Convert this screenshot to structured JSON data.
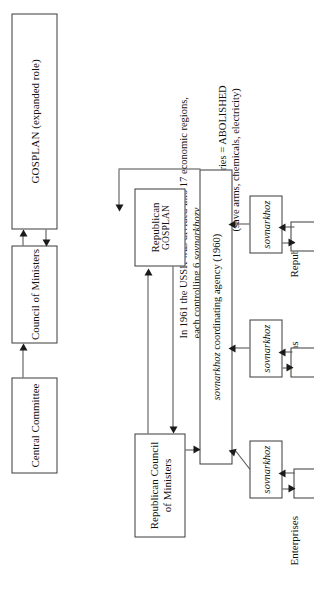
{
  "diagram": {
    "orientation": "rotated-90-counterclockwise",
    "background_color": "#ffffff",
    "line_color": "#4a4a4a",
    "text_color": "#111111"
  },
  "tier_labels": [
    {
      "id": "republics",
      "label": "Republics"
    },
    {
      "id": "regions",
      "label": "Regions"
    },
    {
      "id": "enterprises",
      "label": "Enterprises"
    }
  ],
  "boxes": {
    "gosplan_central": {
      "line1": "GOSPLAN",
      "line2": " (expanded role)"
    },
    "council_ministers": {
      "label": "Council of Ministers"
    },
    "central_committee": {
      "label": "Central Committee"
    },
    "republican_gosplan": {
      "line1": "Republican",
      "line2": "GOSPLAN"
    },
    "republican_council": {
      "line1": "Republican Council",
      "line2": "of Ministers"
    },
    "coordinating_agency": {
      "italic": "sovnarkhoz",
      "rest": " coordinating agency (1960)"
    },
    "sovnarkhoz_1": {
      "label": "sovnarkhoz"
    },
    "sovnarkhoz_2": {
      "label": "sovnarkhoz"
    },
    "sovnarkhoz_3": {
      "label": "sovnarkhoz"
    },
    "enterprise_1": {
      "label": ""
    },
    "enterprise_2": {
      "label": ""
    },
    "enterprise_3": {
      "label": ""
    }
  },
  "notes": {
    "abolished": {
      "line1": "Central Ministries = ABOLISHED",
      "line2": "(save arms, chemicals, electricity)"
    },
    "regions_note": {
      "line1_a": "In 1961 the USSR was divided into 17 economic regions,",
      "line2_a": "each controlling 6 ",
      "line2_italic": "sovnarkhozy"
    }
  }
}
